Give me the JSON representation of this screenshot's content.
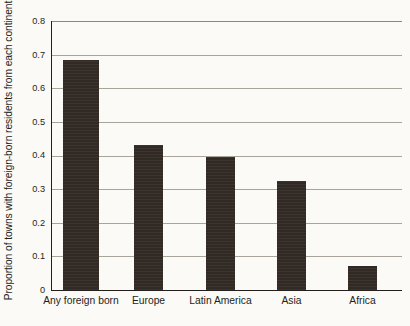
{
  "chart_data": {
    "type": "bar",
    "title": "",
    "subtitle": "",
    "xlabel": "",
    "ylabel": "Proportion of towns with foreign-born residents from each continent",
    "categories": [
      "Any foreign born",
      "Europe",
      "Latin America",
      "Asia",
      "Africa"
    ],
    "values": [
      0.685,
      0.43,
      0.395,
      0.323,
      0.07
    ],
    "series": [
      {
        "name": "Proportion of towns",
        "values": [
          0.685,
          0.43,
          0.395,
          0.323,
          0.07
        ]
      }
    ],
    "ylim": [
      0,
      0.8
    ],
    "ytick_labels": [
      "0.8",
      "0.7",
      "0.6",
      "0.5",
      "0.4",
      "0.3",
      "0.2",
      "0.1",
      "0"
    ],
    "ytick_values": [
      0.8,
      0.7,
      0.6,
      0.5,
      0.4,
      0.3,
      0.2,
      0.1,
      0
    ],
    "grid": true,
    "grid_axis": "y",
    "legend": false,
    "legend_position": "none",
    "bar_color": "#342b26",
    "grid_color": "#a9a49a",
    "axis_color": "#231f1c",
    "background_color": "#fbfaf6"
  }
}
